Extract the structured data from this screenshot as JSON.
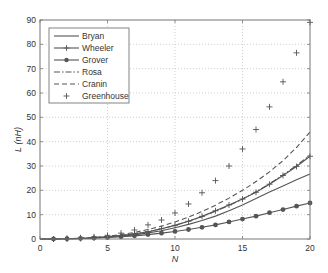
{
  "chart_data": {
    "type": "line",
    "title": "",
    "xlabel": "N",
    "ylabel": "L (nH)",
    "xlim": [
      0,
      20
    ],
    "ylim": [
      0,
      90
    ],
    "xticks": [
      0,
      5,
      10,
      15,
      20
    ],
    "yticks": [
      0,
      10,
      20,
      30,
      40,
      50,
      60,
      70,
      80,
      90
    ],
    "grid": true,
    "legend_position": "upper left",
    "x": [
      1,
      2,
      3,
      4,
      5,
      6,
      7,
      8,
      9,
      10,
      11,
      12,
      13,
      14,
      15,
      16,
      17,
      18,
      19,
      20
    ],
    "series": [
      {
        "name": "Bryan",
        "style": "solid",
        "marker": "none",
        "values": [
          0.0,
          0.1,
          0.2,
          0.4,
          0.7,
          1.1,
          1.7,
          2.5,
          3.4,
          4.6,
          6.0,
          7.6,
          9.4,
          11.6,
          14.0,
          16.6,
          19.3,
          21.8,
          24.3,
          26.7
        ]
      },
      {
        "name": "Wheeler",
        "style": "solid",
        "marker": "+",
        "values": [
          0.0,
          0.1,
          0.2,
          0.5,
          0.9,
          1.4,
          2.1,
          3.0,
          4.2,
          5.6,
          7.3,
          9.3,
          11.6,
          14.0,
          16.4,
          19.2,
          22.5,
          26.1,
          29.8,
          34.0
        ]
      },
      {
        "name": "Grover",
        "style": "solid",
        "marker": "o",
        "values": [
          0.0,
          0.1,
          0.2,
          0.4,
          0.6,
          0.9,
          1.3,
          1.8,
          2.4,
          3.1,
          3.9,
          4.8,
          5.8,
          7.0,
          8.2,
          9.4,
          10.8,
          12.1,
          13.5,
          14.8
        ]
      },
      {
        "name": "Rosa",
        "style": "dashdot",
        "marker": "none",
        "values": [
          0.0,
          0.1,
          0.2,
          0.5,
          0.9,
          1.4,
          2.1,
          3.0,
          4.2,
          5.6,
          7.3,
          9.2,
          11.4,
          13.8,
          16.4,
          19.4,
          22.7,
          26.3,
          30.2,
          34.5
        ]
      },
      {
        "name": "Cranin",
        "style": "dashed",
        "marker": "none",
        "values": [
          0.0,
          0.1,
          0.3,
          0.6,
          1.1,
          1.8,
          2.7,
          3.9,
          5.3,
          7.0,
          9.0,
          11.3,
          13.9,
          16.8,
          20.0,
          23.6,
          27.6,
          32.2,
          37.6,
          44.0
        ]
      },
      {
        "name": "Greenhouse",
        "style": "none",
        "marker": "+",
        "values": [
          0.0,
          0.2,
          0.5,
          0.9,
          1.5,
          2.4,
          3.7,
          5.8,
          7.8,
          10.7,
          14.4,
          19.0,
          24.0,
          30.0,
          37.0,
          45.0,
          54.3,
          64.6,
          76.5,
          89.0
        ]
      }
    ]
  },
  "legend": {
    "items": [
      {
        "label": "Bryan"
      },
      {
        "label": "Wheeler"
      },
      {
        "label": "Grover"
      },
      {
        "label": "Rosa"
      },
      {
        "label": "Cranin"
      },
      {
        "label": "Greenhouse"
      }
    ]
  },
  "axes": {
    "xlabel": "N",
    "ylabel": "L (nH)",
    "xtick_labels": [
      "0",
      "5",
      "10",
      "15",
      "20"
    ],
    "ytick_labels": [
      "0",
      "10",
      "20",
      "30",
      "40",
      "50",
      "60",
      "70",
      "80",
      "90"
    ]
  },
  "colors": {
    "line": "#555555",
    "grid": "#bbbbbb",
    "axis": "#777777"
  }
}
